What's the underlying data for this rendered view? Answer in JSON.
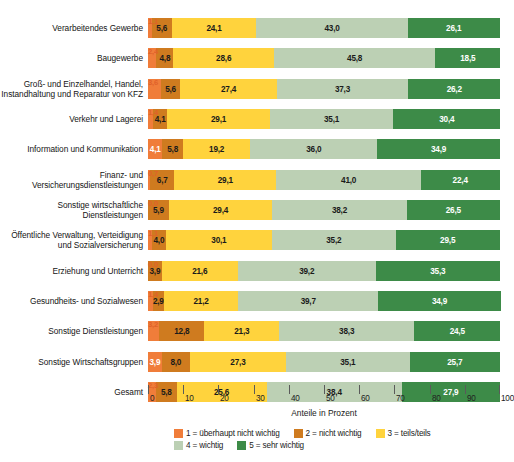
{
  "chart_data": {
    "type": "bar",
    "subtype": "stacked-horizontal-100pct",
    "title": "",
    "xlabel": "Anteile in Prozent",
    "ylabel": "",
    "xlim": [
      0,
      100
    ],
    "xticks": [
      "0",
      "10",
      "20",
      "30",
      "40",
      "50",
      "60",
      "70",
      "80",
      "90",
      "100"
    ],
    "grid": false,
    "legend_position": "bottom",
    "orientation": "horizontal",
    "categories": [
      "Verarbeitendes Gewerbe",
      "Baugewerbe",
      "Groß- und Einzelhandel, Handel, Instandhaltung und Reparatur von KFZ",
      "Verkehr und Lagerei",
      "Information und Kommunikation",
      "Finanz- und Versicherungsdienstleistungen",
      "Sonstige wirtschaftliche Dienstleistungen",
      "Öffentliche Verwaltung, Verteidigung und Sozialversicherung",
      "Erziehung und Unterricht",
      "Gesundheits- und Sozialwesen",
      "Sonstige Dienstleistungen",
      "Sonstige Wirtschaftsgruppen",
      "Gesamt"
    ],
    "series": [
      {
        "name": "1 = überhaupt nicht wichtig",
        "color": "#f07d3a",
        "values": [
          1.1,
          2.4,
          3.6,
          1.4,
          4.1,
          0.7,
          0.0,
          1.1,
          0.0,
          1.4,
          3.2,
          3.9,
          2.3
        ]
      },
      {
        "name": "2 = nicht wichtig",
        "color": "#cf7b1f",
        "values": [
          5.6,
          4.8,
          5.6,
          4.1,
          5.8,
          6.7,
          5.9,
          4.0,
          3.9,
          2.9,
          12.8,
          8.0,
          5.8
        ]
      },
      {
        "name": "3 = teils/teils",
        "color": "#ffd33d",
        "values": [
          24.1,
          28.6,
          27.4,
          29.1,
          19.2,
          29.1,
          29.4,
          30.1,
          21.6,
          21.2,
          21.3,
          27.3,
          25.6
        ]
      },
      {
        "name": "4 = wichtig",
        "color": "#bcd0b4",
        "values": [
          43.0,
          45.8,
          37.3,
          35.1,
          36.0,
          41.0,
          38.2,
          35.2,
          39.2,
          39.7,
          38.3,
          35.1,
          38.4
        ]
      },
      {
        "name": "5 = sehr wichtig",
        "color": "#3d8b48",
        "values": [
          26.1,
          18.5,
          26.2,
          30.4,
          34.9,
          22.4,
          26.5,
          29.5,
          35.3,
          34.9,
          24.5,
          25.7,
          27.9
        ]
      }
    ],
    "rows": [
      {
        "label": "Verarbeitendes Gewerbe",
        "label_lines": [
          "Verarbeitendes Gewerbe"
        ],
        "callout": "1,1",
        "callout_value": 1.1,
        "segments": [
          {
            "series": 1,
            "value": 1.1,
            "text": "1,1",
            "inside": false
          },
          {
            "series": 2,
            "value": 5.6,
            "text": "5,6",
            "inside": true
          },
          {
            "series": 3,
            "value": 24.1,
            "text": "24,1",
            "inside": true
          },
          {
            "series": 4,
            "value": 43.0,
            "text": "43,0",
            "inside": true
          },
          {
            "series": 5,
            "value": 26.1,
            "text": "26,1",
            "inside": true
          }
        ]
      },
      {
        "label": "Baugewerbe",
        "label_lines": [
          "Baugewerbe"
        ],
        "callout": "2,4",
        "callout_value": 2.4,
        "segments": [
          {
            "series": 1,
            "value": 2.4,
            "text": "2,4",
            "inside": false
          },
          {
            "series": 2,
            "value": 4.8,
            "text": "4,8",
            "inside": true
          },
          {
            "series": 3,
            "value": 28.6,
            "text": "28,6",
            "inside": true
          },
          {
            "series": 4,
            "value": 45.8,
            "text": "45,8",
            "inside": true
          },
          {
            "series": 5,
            "value": 18.5,
            "text": "18,5",
            "inside": true
          }
        ]
      },
      {
        "label": "Groß- und Einzelhandel, Handel, Instandhaltung und Reparatur von KFZ",
        "label_lines": [
          "Groß- und Einzelhandel, Handel,",
          "Instandhaltung und Reparatur von KFZ"
        ],
        "callout": "3,6",
        "callout_value": 3.6,
        "segments": [
          {
            "series": 1,
            "value": 3.6,
            "text": "3,6",
            "inside": false
          },
          {
            "series": 2,
            "value": 5.6,
            "text": "5,6",
            "inside": true
          },
          {
            "series": 3,
            "value": 27.4,
            "text": "27,4",
            "inside": true
          },
          {
            "series": 4,
            "value": 37.3,
            "text": "37,3",
            "inside": true
          },
          {
            "series": 5,
            "value": 26.2,
            "text": "26,2",
            "inside": true
          }
        ]
      },
      {
        "label": "Verkehr und Lagerei",
        "label_lines": [
          "Verkehr und Lagerei"
        ],
        "callout": "1,4",
        "callout_value": 1.4,
        "segments": [
          {
            "series": 1,
            "value": 1.4,
            "text": "1,4",
            "inside": false
          },
          {
            "series": 2,
            "value": 4.1,
            "text": "4,1",
            "inside": true
          },
          {
            "series": 3,
            "value": 29.1,
            "text": "29,1",
            "inside": true
          },
          {
            "series": 4,
            "value": 35.1,
            "text": "35,1",
            "inside": true
          },
          {
            "series": 5,
            "value": 30.4,
            "text": "30,4",
            "inside": true
          }
        ]
      },
      {
        "label": "Information und Kommunikation",
        "label_lines": [
          "Information und Kommunikation"
        ],
        "callout": "",
        "callout_value": null,
        "segments": [
          {
            "series": 1,
            "value": 4.1,
            "text": "4,1",
            "inside": true
          },
          {
            "series": 2,
            "value": 5.8,
            "text": "5,8",
            "inside": true
          },
          {
            "series": 3,
            "value": 19.2,
            "text": "19,2",
            "inside": true
          },
          {
            "series": 4,
            "value": 36.0,
            "text": "36,0",
            "inside": true
          },
          {
            "series": 5,
            "value": 34.9,
            "text": "34,9",
            "inside": true
          }
        ]
      },
      {
        "label": "Finanz- und Versicherungsdienstleistungen",
        "label_lines": [
          "Finanz- und",
          "Versicherungsdienstleistungen"
        ],
        "callout": "0,7",
        "callout_value": 0.7,
        "segments": [
          {
            "series": 1,
            "value": 0.7,
            "text": "0,7",
            "inside": false
          },
          {
            "series": 2,
            "value": 6.7,
            "text": "6,7",
            "inside": true
          },
          {
            "series": 3,
            "value": 29.1,
            "text": "29,1",
            "inside": true
          },
          {
            "series": 4,
            "value": 41.0,
            "text": "41,0",
            "inside": true
          },
          {
            "series": 5,
            "value": 22.4,
            "text": "22,4",
            "inside": true
          }
        ]
      },
      {
        "label": "Sonstige wirtschaftliche Dienstleistungen",
        "label_lines": [
          "Sonstige wirtschaftliche",
          "Dienstleistungen"
        ],
        "callout": "0,0",
        "callout_value": 0.0,
        "segments": [
          {
            "series": 1,
            "value": 0.0,
            "text": "0,0",
            "inside": false
          },
          {
            "series": 2,
            "value": 5.9,
            "text": "5,9",
            "inside": true
          },
          {
            "series": 3,
            "value": 29.4,
            "text": "29,4",
            "inside": true
          },
          {
            "series": 4,
            "value": 38.2,
            "text": "38,2",
            "inside": true
          },
          {
            "series": 5,
            "value": 26.5,
            "text": "26,5",
            "inside": true
          }
        ]
      },
      {
        "label": "Öffentliche Verwaltung, Verteidigung und Sozialversicherung",
        "label_lines": [
          "Öffentliche Verwaltung, Verteidigung",
          "und Sozialversicherung"
        ],
        "callout": "1,1",
        "callout_value": 1.1,
        "segments": [
          {
            "series": 1,
            "value": 1.1,
            "text": "1,1",
            "inside": false
          },
          {
            "series": 2,
            "value": 4.0,
            "text": "4,0",
            "inside": true
          },
          {
            "series": 3,
            "value": 30.1,
            "text": "30,1",
            "inside": true
          },
          {
            "series": 4,
            "value": 35.2,
            "text": "35,2",
            "inside": true
          },
          {
            "series": 5,
            "value": 29.5,
            "text": "29,5",
            "inside": true
          }
        ]
      },
      {
        "label": "Erziehung und Unterricht",
        "label_lines": [
          "Erziehung und Unterricht"
        ],
        "callout": "0,0",
        "callout_value": 0.0,
        "segments": [
          {
            "series": 1,
            "value": 0.0,
            "text": "0,0",
            "inside": false
          },
          {
            "series": 2,
            "value": 3.9,
            "text": "3,9",
            "inside": true
          },
          {
            "series": 3,
            "value": 21.6,
            "text": "21,6",
            "inside": true
          },
          {
            "series": 4,
            "value": 39.2,
            "text": "39,2",
            "inside": true
          },
          {
            "series": 5,
            "value": 35.3,
            "text": "35,3",
            "inside": true
          }
        ]
      },
      {
        "label": "Gesundheits- und Sozialwesen",
        "label_lines": [
          "Gesundheits- und Sozialwesen"
        ],
        "callout": "1,4",
        "callout_value": 1.4,
        "segments": [
          {
            "series": 1,
            "value": 1.4,
            "text": "1,4",
            "inside": false
          },
          {
            "series": 2,
            "value": 2.9,
            "text": "2,9",
            "inside": true
          },
          {
            "series": 3,
            "value": 21.2,
            "text": "21,2",
            "inside": true
          },
          {
            "series": 4,
            "value": 39.7,
            "text": "39,7",
            "inside": true
          },
          {
            "series": 5,
            "value": 34.9,
            "text": "34,9",
            "inside": true
          }
        ]
      },
      {
        "label": "Sonstige Dienstleistungen",
        "label_lines": [
          "Sonstige Dienstleistungen"
        ],
        "callout": "3,2",
        "callout_value": 3.2,
        "segments": [
          {
            "series": 1,
            "value": 3.2,
            "text": "3,2",
            "inside": false
          },
          {
            "series": 2,
            "value": 12.8,
            "text": "12,8",
            "inside": true
          },
          {
            "series": 3,
            "value": 21.3,
            "text": "21,3",
            "inside": true
          },
          {
            "series": 4,
            "value": 38.3,
            "text": "38,3",
            "inside": true
          },
          {
            "series": 5,
            "value": 24.5,
            "text": "24,5",
            "inside": true
          }
        ]
      },
      {
        "label": "Sonstige Wirtschaftsgruppen",
        "label_lines": [
          "Sonstige Wirtschaftsgruppen"
        ],
        "callout": "",
        "callout_value": null,
        "segments": [
          {
            "series": 1,
            "value": 3.9,
            "text": "3,9",
            "inside": true
          },
          {
            "series": 2,
            "value": 8.0,
            "text": "8,0",
            "inside": true
          },
          {
            "series": 3,
            "value": 27.3,
            "text": "27,3",
            "inside": true
          },
          {
            "series": 4,
            "value": 35.1,
            "text": "35,1",
            "inside": true
          },
          {
            "series": 5,
            "value": 25.7,
            "text": "25,7",
            "inside": true
          }
        ]
      },
      {
        "label": "Gesamt",
        "label_lines": [
          "Gesamt"
        ],
        "callout": "2,3",
        "callout_value": 2.3,
        "segments": [
          {
            "series": 1,
            "value": 2.3,
            "text": "2,3",
            "inside": false
          },
          {
            "series": 2,
            "value": 5.8,
            "text": "5,8",
            "inside": true
          },
          {
            "series": 3,
            "value": 25.6,
            "text": "25,6",
            "inside": true
          },
          {
            "series": 4,
            "value": 38.4,
            "text": "38,4",
            "inside": true
          },
          {
            "series": 5,
            "value": 27.9,
            "text": "27,9",
            "inside": true
          }
        ]
      }
    ]
  },
  "legend": {
    "row1": [
      {
        "label": "1 = überhaupt nicht wichtig",
        "color": "#f07d3a",
        "swatch": "sw1"
      },
      {
        "label": "2 = nicht wichtig",
        "color": "#cf7b1f",
        "swatch": "sw2"
      },
      {
        "label": "3 = teils/teils",
        "color": "#ffd33d",
        "swatch": "sw3"
      }
    ],
    "row2": [
      {
        "label": "4 = wichtig",
        "color": "#bcd0b4",
        "swatch": "sw4"
      },
      {
        "label": "5 = sehr wichtig",
        "color": "#3d8b48",
        "swatch": "sw5"
      }
    ]
  },
  "axis": {
    "title": "Anteile in Prozent",
    "ticks": [
      "0",
      "10",
      "20",
      "30",
      "40",
      "50",
      "60",
      "70",
      "80",
      "90",
      "100"
    ]
  },
  "colors": {
    "series1": "#f07d3a",
    "series2": "#cf7b1f",
    "series3": "#ffd33d",
    "series4": "#bcd0b4",
    "series5": "#3d8b48",
    "callout_text": "#e0622a",
    "background": "#ffffff"
  }
}
